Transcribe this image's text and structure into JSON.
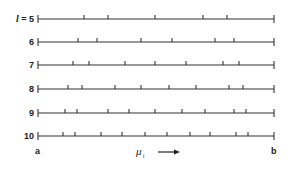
{
  "diagram": {
    "type": "number-line-partitions",
    "line_color": "#333333",
    "x_start": 38,
    "x_end": 274,
    "rows": [
      {
        "label": "l = 5",
        "label_var": "l",
        "label_eq": " = 5",
        "y": 19,
        "ticks": [
          38,
          84,
          108,
          155,
          203,
          227,
          274
        ]
      },
      {
        "label": "6",
        "y": 42,
        "ticks": [
          38,
          78,
          97,
          141,
          172,
          215,
          234,
          274
        ]
      },
      {
        "label": "7",
        "y": 65,
        "ticks": [
          38,
          73,
          89,
          125,
          155,
          186,
          223,
          239,
          274
        ]
      },
      {
        "label": "8",
        "y": 89,
        "ticks": [
          38,
          68,
          82,
          115,
          141,
          169,
          196,
          229,
          243,
          274
        ]
      },
      {
        "label": "9",
        "y": 113,
        "ticks": [
          38,
          65,
          77,
          108,
          129,
          155,
          182,
          205,
          234,
          246,
          274
        ]
      },
      {
        "label": "10",
        "y": 136,
        "ticks": [
          38,
          63,
          75,
          101,
          122,
          145,
          167,
          190,
          210,
          236,
          248,
          274
        ]
      }
    ],
    "left_endpoint": "a",
    "right_endpoint": "b",
    "axis_symbol": "μ",
    "axis_subscript": "i",
    "arrow": "→"
  }
}
